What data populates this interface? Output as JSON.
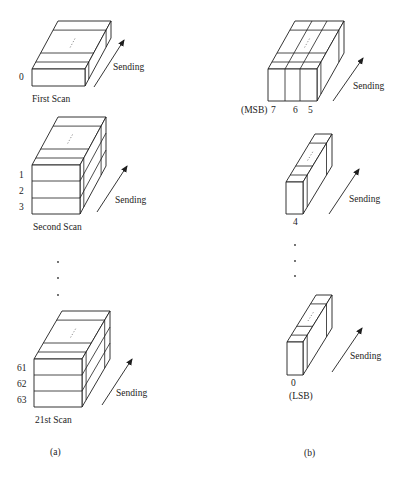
{
  "figure": {
    "panel_a": {
      "label": "(a)",
      "scans": [
        {
          "row_labels": [
            "0"
          ],
          "caption": "First Scan",
          "arrow_label": "Sending"
        },
        {
          "row_labels": [
            "1",
            "2",
            "3"
          ],
          "caption": "Second Scan",
          "arrow_label": "Sending"
        },
        {
          "row_labels": [
            "61",
            "62",
            "63"
          ],
          "caption": "21st Scan",
          "arrow_label": "Sending"
        }
      ],
      "ellipsis_dots": 3
    },
    "panel_b": {
      "label": "(b)",
      "planes": [
        {
          "prefix": "(MSB)",
          "bit_labels": [
            "7",
            "6",
            "5"
          ],
          "arrow_label": "Sending"
        },
        {
          "bit_labels": [
            "4"
          ],
          "arrow_label": "Sending"
        },
        {
          "bit_labels": [
            "0"
          ],
          "suffix": "(LSB)",
          "arrow_label": "Sending"
        }
      ],
      "ellipsis_dots": 3
    },
    "colors": {
      "line": "#1e1e1e",
      "text": "#222222",
      "background": "#ffffff"
    }
  }
}
